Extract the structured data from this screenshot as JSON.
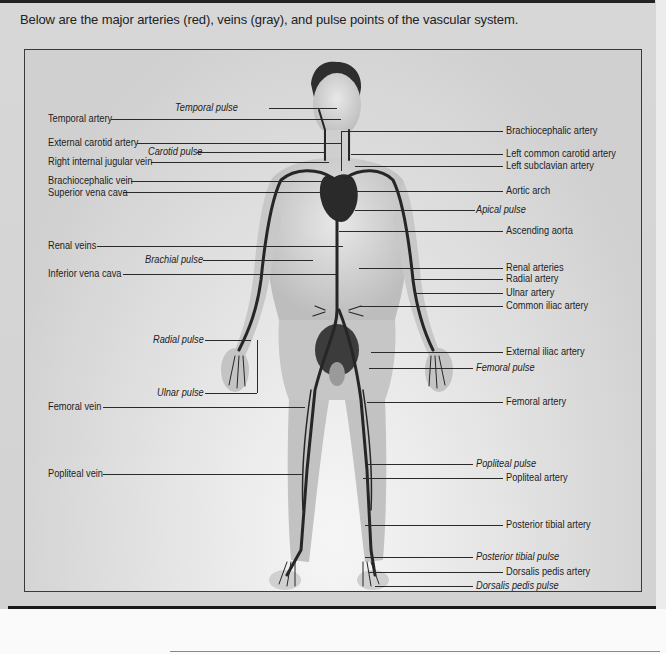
{
  "intro_text": "Below are the major arteries (red), veins (gray), and pulse points of the vascular system.",
  "figure": {
    "colors": {
      "artery": "#c0392b",
      "vein": "#7a7a7a",
      "rendered_tone": "#2a2a2a"
    },
    "left_labels": [
      {
        "id": "temporal-pulse",
        "text": "Temporal pulse",
        "type": "pulse"
      },
      {
        "id": "temporal-artery",
        "text": "Temporal artery",
        "type": "artery"
      },
      {
        "id": "external-carotid-artery",
        "text": "External carotid artery",
        "type": "artery"
      },
      {
        "id": "carotid-pulse",
        "text": "Carotid pulse",
        "type": "pulse"
      },
      {
        "id": "right-internal-jugular-vein",
        "text": "Right internal jugular vein",
        "type": "vein"
      },
      {
        "id": "brachiocephalic-vein",
        "text": "Brachiocephalic vein",
        "type": "vein"
      },
      {
        "id": "superior-vena-cava",
        "text": "Superior vena cava",
        "type": "vein"
      },
      {
        "id": "renal-veins",
        "text": "Renal veins",
        "type": "vein"
      },
      {
        "id": "brachial-pulse",
        "text": "Brachial pulse",
        "type": "pulse"
      },
      {
        "id": "inferior-vena-cava",
        "text": "Inferior vena cava",
        "type": "vein"
      },
      {
        "id": "radial-pulse",
        "text": "Radial pulse",
        "type": "pulse"
      },
      {
        "id": "ulnar-pulse",
        "text": "Ulnar pulse",
        "type": "pulse"
      },
      {
        "id": "femoral-vein",
        "text": "Femoral vein",
        "type": "vein"
      },
      {
        "id": "popliteal-vein",
        "text": "Popliteal vein",
        "type": "vein"
      }
    ],
    "right_labels": [
      {
        "id": "brachiocephalic-artery",
        "text": "Brachiocephalic artery",
        "type": "artery"
      },
      {
        "id": "left-common-carotid-artery",
        "text": "Left common carotid artery",
        "type": "artery"
      },
      {
        "id": "left-subclavian-artery",
        "text": "Left subclavian artery",
        "type": "artery"
      },
      {
        "id": "aortic-arch",
        "text": "Aortic arch",
        "type": "artery"
      },
      {
        "id": "apical-pulse",
        "text": "Apical pulse",
        "type": "pulse"
      },
      {
        "id": "ascending-aorta",
        "text": "Ascending aorta",
        "type": "artery"
      },
      {
        "id": "renal-arteries",
        "text": "Renal arteries",
        "type": "artery"
      },
      {
        "id": "radial-artery",
        "text": "Radial artery",
        "type": "artery"
      },
      {
        "id": "ulnar-artery",
        "text": "Ulnar artery",
        "type": "artery"
      },
      {
        "id": "common-iliac-artery",
        "text": "Common iliac artery",
        "type": "artery"
      },
      {
        "id": "external-iliac-artery",
        "text": "External iliac artery",
        "type": "artery"
      },
      {
        "id": "femoral-pulse",
        "text": "Femoral pulse",
        "type": "pulse"
      },
      {
        "id": "femoral-artery",
        "text": "Femoral artery",
        "type": "artery"
      },
      {
        "id": "popliteal-pulse",
        "text": "Popliteal pulse",
        "type": "pulse"
      },
      {
        "id": "popliteal-artery",
        "text": "Popliteal artery",
        "type": "artery"
      },
      {
        "id": "posterior-tibial-artery",
        "text": "Posterior tibial artery",
        "type": "artery"
      },
      {
        "id": "posterior-tibial-pulse",
        "text": "Posterior tibial pulse",
        "type": "pulse"
      },
      {
        "id": "dorsalis-pedis-artery",
        "text": "Dorsalis pedis artery",
        "type": "artery"
      },
      {
        "id": "dorsalis-pedis-pulse",
        "text": "Dorsalis pedis pulse",
        "type": "pulse"
      }
    ]
  }
}
